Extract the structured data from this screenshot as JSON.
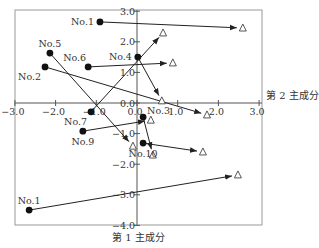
{
  "chart_data": {
    "type": "scatter",
    "subtype": "arrow-biplot",
    "title": "",
    "xlabel": "第 2 主成分",
    "ylabel": "第 1 主成分",
    "xlim": [
      -3.0,
      3.0
    ],
    "ylim": [
      -4.0,
      3.0
    ],
    "x_ticks": [
      -3.0,
      -2.0,
      -1.0,
      0.0,
      1.0,
      2.0,
      3.0
    ],
    "x_tick_labels": [
      "−3.0",
      "−2.0",
      "−1.0",
      "0.0",
      "1.0",
      "2.0",
      "3.0"
    ],
    "y_ticks": [
      3.0,
      2.0,
      1.0,
      0.0,
      -1.0,
      -2.0,
      -3.0,
      -4.0
    ],
    "y_tick_labels": [
      "3.0",
      "2.0",
      "1.0",
      "0.0",
      "−1.0",
      "−2.0",
      "−3.0",
      "−4.0"
    ],
    "grid": false,
    "legend": null,
    "marker_start": "filled-circle",
    "marker_end": "open-triangle",
    "series": [
      {
        "name": "No.1",
        "start": [
          -0.91,
          2.65
        ],
        "end": [
          2.6,
          2.45
        ],
        "label_pos": "left"
      },
      {
        "name": "No.2",
        "start": [
          -2.26,
          1.18
        ],
        "end": [
          1.72,
          -0.39
        ],
        "label_pos": "below-left"
      },
      {
        "name": "No.3",
        "start": [
          0.15,
          -0.46
        ],
        "end": [
          0.39,
          -1.7
        ],
        "label_pos": "above-right"
      },
      {
        "name": "No.4",
        "start": [
          0.02,
          1.5
        ],
        "end": [
          0.61,
          0.07
        ],
        "label_pos": "left"
      },
      {
        "name": "No.5",
        "start": [
          -2.14,
          1.63
        ],
        "end": [
          -0.1,
          -1.41
        ],
        "label_pos": "above"
      },
      {
        "name": "No.6",
        "start": [
          -1.2,
          1.18
        ],
        "end": [
          0.88,
          1.31
        ],
        "label_pos": "above-left"
      },
      {
        "name": "No.7",
        "start": [
          -1.13,
          -0.29
        ],
        "end": [
          0.64,
          2.29
        ],
        "label_pos": "below-left"
      },
      {
        "name": "No.9",
        "start": [
          -1.33,
          -0.92
        ],
        "end": [
          0.34,
          -0.56
        ],
        "label_pos": "below"
      },
      {
        "name": "No.10",
        "start": [
          0.15,
          -1.31
        ],
        "end": [
          1.62,
          -1.6
        ],
        "label_pos": "below"
      },
      {
        "name": "No.1",
        "start": [
          -2.65,
          -3.5
        ],
        "end": [
          2.48,
          -2.35
        ],
        "label_pos": "above"
      }
    ]
  },
  "colors": {
    "frame": "#888888",
    "axis": "#555555",
    "line": "#222222",
    "point": "#111111",
    "text": "#333333"
  }
}
